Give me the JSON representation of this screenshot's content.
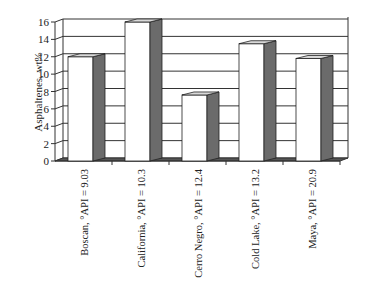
{
  "chart_data": {
    "type": "bar",
    "style": "3d-column",
    "title": "",
    "xlabel": "",
    "ylabel": "Asphaltenes, wt%",
    "ylim": [
      0,
      16
    ],
    "yticks": [
      0,
      2,
      4,
      6,
      8,
      10,
      12,
      14,
      16
    ],
    "grid": true,
    "legend": null,
    "categories": [
      "Boscan, °API = 9.03",
      "California, °API = 10.3",
      "Cerro Negro, °API = 12.4",
      "Cold Lake, °API = 13.2",
      "Maya, °API = 20.9"
    ],
    "values": [
      12.0,
      16.0,
      7.6,
      13.5,
      11.8
    ]
  },
  "colors": {
    "bar_front": "#ffffff",
    "bar_side": "#6b6b6b",
    "bar_top": "#d9d9d9",
    "grid": "#333333",
    "axis": "#333333"
  }
}
